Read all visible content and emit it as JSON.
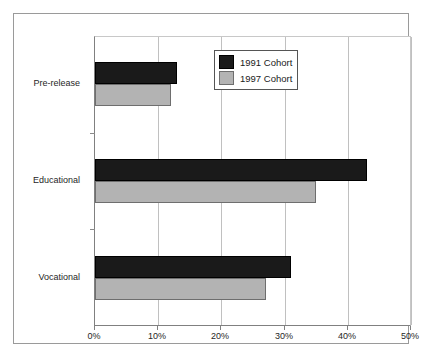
{
  "chart_data": {
    "type": "bar",
    "orientation": "horizontal",
    "title": "",
    "xlabel": "",
    "ylabel": "",
    "categories": [
      "Pre-release",
      "Educational",
      "Vocational"
    ],
    "series": [
      {
        "name": "1991 Cohort",
        "color": "#1a1a1a",
        "values": [
          13,
          43,
          31
        ]
      },
      {
        "name": "1997 Cohort",
        "color": "#b3b3b3",
        "values": [
          12,
          35,
          27
        ]
      }
    ],
    "xlim": [
      0,
      50
    ],
    "xticks": [
      0,
      10,
      20,
      30,
      40,
      50
    ],
    "xtick_labels": [
      "0%",
      "10%",
      "20%",
      "30%",
      "40%",
      "50%"
    ],
    "grid": true,
    "grid_axis": "x",
    "legend_position": "top-right",
    "legend_entries": [
      "1991 Cohort",
      "1997 Cohort"
    ]
  },
  "axis": {
    "x": {
      "tick_labels": [
        "0%",
        "10%",
        "20%",
        "30%",
        "40%",
        "50%"
      ]
    },
    "y": {
      "tick_labels": [
        "Pre-release",
        "Educational",
        "Vocational"
      ]
    }
  },
  "legend": {
    "items": [
      {
        "label": "1991 Cohort"
      },
      {
        "label": "1997 Cohort"
      }
    ]
  }
}
